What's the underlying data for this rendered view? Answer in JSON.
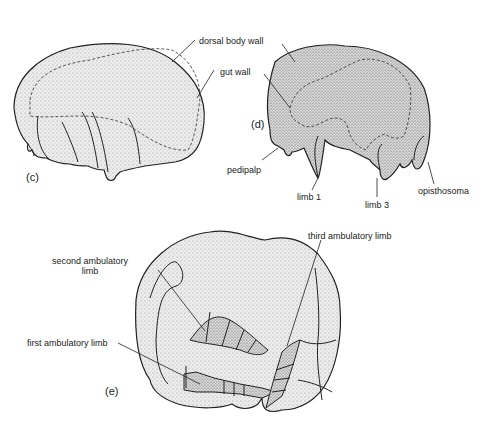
{
  "figure": {
    "panels": [
      {
        "id": "c",
        "label": "(c)"
      },
      {
        "id": "d",
        "label": "(d)"
      },
      {
        "id": "e",
        "label": "(e)"
      }
    ],
    "labels": {
      "dorsal_body_wall": "dorsal body wall",
      "gut_wall": "gut wall",
      "pedipalp": "pedipalp",
      "limb_1": "limb 1",
      "limb_3": "limb 3",
      "opisthosoma": "opisthosoma",
      "second_ambulatory_limb_line1": "second ambulatory",
      "second_ambulatory_limb_line2": "limb",
      "first_ambulatory_limb": "first ambulatory limb",
      "third_ambulatory_limb": "third ambulatory limb"
    },
    "colors": {
      "ink": "#222222",
      "fill": "#e6e6e6",
      "background": "#ffffff"
    }
  }
}
